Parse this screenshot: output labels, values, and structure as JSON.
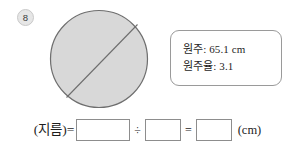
{
  "problem": {
    "number": "8",
    "badge_color": "#e6e6e6"
  },
  "figure": {
    "shape_name": "circle-with-diameter",
    "fill_color": "#d8d8d8",
    "stroke_color": "#6e6e6e",
    "diameter_line_label": ""
  },
  "info_box": {
    "lines": [
      "원주: 65.1 cm",
      "원주율: 3.1"
    ],
    "circumference_label": "원주",
    "circumference_value": "65.1 cm",
    "pi_label": "원주율",
    "pi_value": "3.1",
    "border_color": "#9a9a9a"
  },
  "equation": {
    "lhs": "(지름)=",
    "operator_divide": "÷",
    "operator_equals": "=",
    "unit": "(cm)",
    "blank_1": "",
    "blank_2": "",
    "blank_3": ""
  }
}
